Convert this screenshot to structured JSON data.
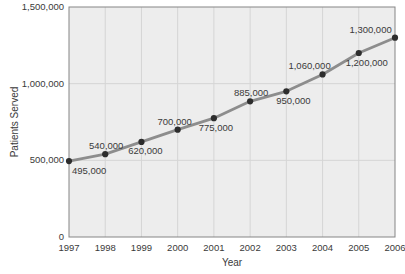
{
  "chart_data": {
    "type": "line",
    "title": "",
    "xlabel": "Year",
    "ylabel": "Patients Served",
    "categories": [
      "1997",
      "1998",
      "1999",
      "2000",
      "2001",
      "2002",
      "2003",
      "2004",
      "2005",
      "2006"
    ],
    "series": [
      {
        "name": "Patients Served",
        "values": [
          495000,
          540000,
          620000,
          700000,
          775000,
          885000,
          950000,
          1060000,
          1200000,
          1300000
        ]
      }
    ],
    "point_labels": [
      "495,000",
      "540,000",
      "620,000",
      "700,000",
      "775,000",
      "885,000",
      "950,000",
      "1,060,000",
      "1,200,000",
      "1,300,000"
    ],
    "point_label_side": [
      "below",
      "above",
      "below",
      "above",
      "below",
      "above",
      "below",
      "above",
      "below",
      "above"
    ],
    "point_label_dx": [
      0,
      1,
      4,
      -3,
      2,
      1,
      7,
      -13,
      8,
      0
    ],
    "ylim": [
      0,
      1500000
    ],
    "yticks": {
      "values": [
        0,
        500000,
        1000000,
        1500000
      ],
      "labels": [
        "0",
        "500,000",
        "1,000,000",
        "1,500,000"
      ]
    },
    "grid": true,
    "legend": "none",
    "colors": {
      "line": "#8d8d8d",
      "marker": "#2d2d2d",
      "plot_bg": "#ededed",
      "grid": "#d5d5d5",
      "border": "#858585",
      "text": "#3a3a3a"
    }
  }
}
